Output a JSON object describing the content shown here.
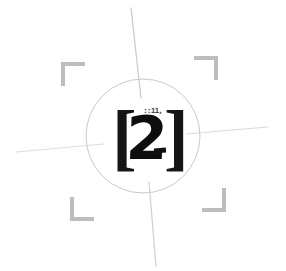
{
  "canvas": {
    "width": 286,
    "height": 271,
    "background_color": "#ffffff"
  },
  "target": {
    "label": "registration-target",
    "description": "Scanned alignment / registration target with crosshairs, circle, corner brackets and a stamped bracketed numeral"
  },
  "stamp": {
    "bracket_left": "[",
    "digit": "2",
    "bracket_right": "]",
    "superscript": "::11,",
    "ink_color": "#0d0d0d"
  },
  "circle": {
    "center_x": 143,
    "center_y": 136,
    "radius": 57,
    "stroke_color": "#c9c9c9",
    "stroke_width": 1
  },
  "crosshairs": {
    "stroke_color": "#c4c4c4",
    "lines": [
      {
        "name": "vertical-top",
        "x1": 131,
        "y1": 8,
        "x2": 141,
        "y2": 98,
        "opacity": 0.85,
        "width": 1.3
      },
      {
        "name": "vertical-bottom",
        "x1": 149,
        "y1": 182,
        "x2": 156,
        "y2": 266,
        "opacity": 0.75,
        "width": 1.3
      },
      {
        "name": "horizontal-left",
        "x1": 16,
        "y1": 152,
        "x2": 104,
        "y2": 144,
        "opacity": 0.55,
        "width": 1.2
      },
      {
        "name": "horizontal-right",
        "x1": 186,
        "y1": 134,
        "x2": 268,
        "y2": 127,
        "opacity": 0.6,
        "width": 1.2
      }
    ]
  },
  "corner_brackets": {
    "stroke_color": "#bdbdbd",
    "stroke_width": 4,
    "arm_length": 22,
    "items": [
      {
        "name": "corner-bracket-top-left",
        "corner_x": 63,
        "corner_y": 64,
        "dir_x": 1,
        "dir_y": 1
      },
      {
        "name": "corner-bracket-top-right",
        "corner_x": 216,
        "corner_y": 58,
        "dir_x": -1,
        "dir_y": 1
      },
      {
        "name": "corner-bracket-bottom-left",
        "corner_x": 72,
        "corner_y": 219,
        "dir_x": 1,
        "dir_y": -1
      },
      {
        "name": "corner-bracket-bottom-right",
        "corner_x": 224,
        "corner_y": 210,
        "dir_x": -1,
        "dir_y": -1
      }
    ]
  }
}
